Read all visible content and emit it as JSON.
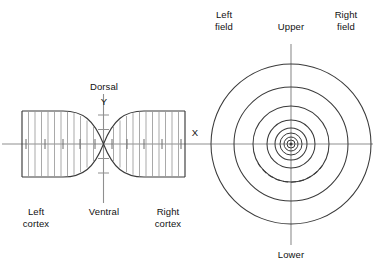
{
  "figure": {
    "title": "",
    "background_color": "#ffffff",
    "stroke_color": "#3a3a3a",
    "axis_color": "#8a8a8a",
    "text_color": "#111111"
  },
  "cortex_diagram": {
    "name": "cortical-surface-map",
    "shape": "hourglass",
    "axes": {
      "y_axis_label": "Y",
      "y_axis_top_label": "Dorsal",
      "y_axis_bottom_label": "Ventral",
      "x_axis_label": "X"
    },
    "labels": {
      "left_region_line1": "Left",
      "left_region_line2": "cortex",
      "right_region_line1": "Right",
      "right_region_line2": "cortex"
    },
    "grid_line_count_left": 11,
    "grid_line_count_right": 11,
    "tick_count_left": 5,
    "tick_count_right": 5
  },
  "visual_field_diagram": {
    "name": "visual-field-map",
    "shape": "concentric-circles",
    "ring_count": 8,
    "ring_radii": [
      4,
      7,
      11,
      16,
      24,
      38,
      57,
      80
    ],
    "axes": {
      "vertical_top_label": "Upper",
      "vertical_bottom_label": "Lower",
      "horizontal_label": "X"
    },
    "labels": {
      "left_field_line1": "Left",
      "left_field_line2": "field",
      "right_field_line1": "Right",
      "right_field_line2": "field"
    },
    "dashed_ring_index": 6
  }
}
